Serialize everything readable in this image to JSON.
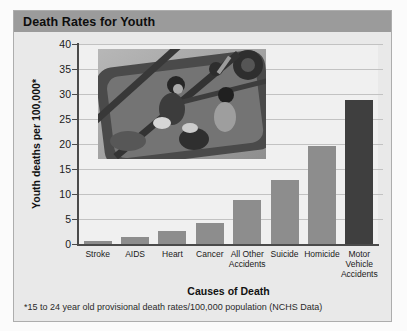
{
  "panel": {
    "title_bar": "Death Rates for Youth"
  },
  "chart_data": {
    "type": "bar",
    "title": "Death Rates for Youth",
    "categories": [
      "Stroke",
      "AIDS",
      "Heart",
      "Cancer",
      "All Other\nAccidents",
      "Suicide",
      "Homicide",
      "Motor\nVehicle\nAccidents"
    ],
    "values": [
      0.7,
      1.5,
      2.7,
      4.3,
      8.8,
      12.8,
      19.7,
      28.9
    ],
    "xlabel": "Causes of Death",
    "ylabel": "Youth deaths per 100,000*",
    "ylim": [
      0,
      40
    ],
    "ytick_step": 5,
    "grid": true,
    "legend": "none",
    "bar_color": "#8d8d8d",
    "highlight_index": 7,
    "highlight_color": "#3f3f3f"
  },
  "footnote": "*15 to 24 year old provisional death rates/100,000 population (NCHS Data)",
  "photo": {
    "description": "grayscale photo of youths riding in a convertible car, viewed from above"
  },
  "colors": {
    "panel_bg": "#e9e9e9",
    "titlebar_bg": "#9b9b9b",
    "plot_bg": "#f0f0f0",
    "gridline": "#c2c2c2",
    "axis": "#4a4a4a"
  }
}
